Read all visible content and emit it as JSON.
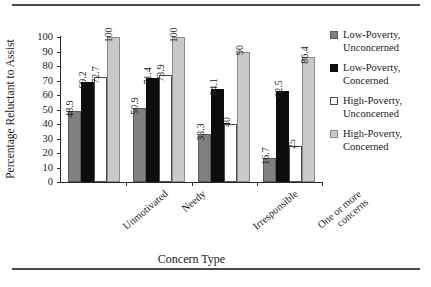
{
  "chart_data": {
    "type": "bar",
    "title": "",
    "xlabel": "Concern Type",
    "ylabel": "Percentage Reluctant to Assist",
    "ylim": [
      0,
      100
    ],
    "yticks": [
      0,
      10,
      20,
      30,
      40,
      50,
      60,
      70,
      80,
      90,
      100
    ],
    "grid": false,
    "legend_position": "right",
    "categories": [
      "Unmotivated",
      "Needy",
      "Irresponsible",
      "One or more concerns"
    ],
    "category_lines": [
      [
        "Unmotivated"
      ],
      [
        "Needy"
      ],
      [
        "Irresponsible"
      ],
      [
        "One or more",
        "concerns"
      ]
    ],
    "series": [
      {
        "name": "Low-Poverty, Unconcerned",
        "name_lines": [
          "Low-Poverty,",
          "Unconcerned"
        ],
        "color": "#808080",
        "values": [
          48.9,
          50.9,
          33.3,
          16.7
        ],
        "labels": [
          "48.9",
          "50.9",
          "33.3",
          "16.7"
        ]
      },
      {
        "name": "Low-Poverty, Concerned",
        "name_lines": [
          "Low-Poverty,",
          "Concerned"
        ],
        "color": "#0d0d0d",
        "values": [
          69.2,
          71.4,
          64.1,
          62.5
        ],
        "labels": [
          "69.2",
          "71.4",
          "64.1",
          "62.5"
        ]
      },
      {
        "name": "High-Poverty, Unconcerned",
        "name_lines": [
          "High-Poverty,",
          "Unconcerned"
        ],
        "color": "#ffffff",
        "values": [
          72.7,
          73.9,
          40,
          25
        ],
        "labels": [
          "72.7",
          "73.9",
          "40",
          "25"
        ]
      },
      {
        "name": "High-Poverty, Concerned",
        "name_lines": [
          "High-Poverty,",
          "Concerned"
        ],
        "color": "#c9c9c9",
        "values": [
          100,
          100,
          90,
          86.4
        ],
        "labels": [
          "100",
          "100",
          "90",
          "86.4"
        ]
      }
    ]
  }
}
